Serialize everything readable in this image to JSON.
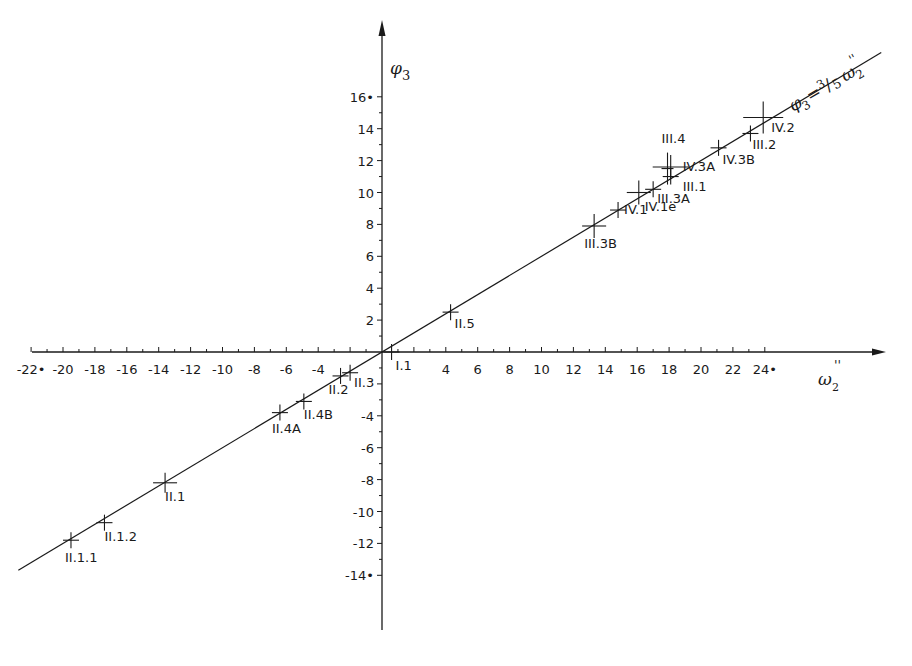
{
  "chart_data": {
    "type": "scatter",
    "title": "",
    "xlabel": "ω2''",
    "ylabel": "φ3",
    "xlim": [
      -22,
      24
    ],
    "ylim": [
      -14,
      16
    ],
    "grid": false,
    "x_ticks": [
      -22,
      -20,
      -18,
      -16,
      -14,
      -12,
      -10,
      -8,
      -6,
      -4,
      4,
      6,
      8,
      10,
      12,
      14,
      16,
      18,
      20,
      22,
      24
    ],
    "x_tick_labels": [
      "-22•",
      "-20",
      "-18",
      "-16",
      "-14",
      "-12",
      "-10",
      "-8",
      "-6",
      "-4",
      "4",
      "6",
      "8",
      "10",
      "12",
      "14",
      "16",
      "18",
      "20",
      "22",
      "24•"
    ],
    "y_ticks": [
      16,
      14,
      12,
      10,
      8,
      6,
      4,
      2,
      -4,
      -6,
      -8,
      -10,
      -12,
      -14
    ],
    "y_tick_labels": [
      "16•",
      "14",
      "12",
      "10",
      "8",
      "6",
      "4",
      "2",
      "-4",
      "-6",
      "-8",
      "-10",
      "-12",
      "-14•"
    ],
    "fit_line": {
      "label": "φ3 = 3/5 ω2''",
      "slope": 0.6,
      "intercept": 0,
      "x_range": [
        -22.8,
        31.3
      ]
    },
    "points": [
      {
        "label": "I.1",
        "x": 0.6,
        "y": 0.0
      },
      {
        "label": "II.5",
        "x": 4.3,
        "y": 2.5
      },
      {
        "label": "II.3",
        "x": -2.0,
        "y": -1.3
      },
      {
        "label": "II.2",
        "x": -2.6,
        "y": -1.5
      },
      {
        "label": "II.4B",
        "x": -4.9,
        "y": -3.1
      },
      {
        "label": "II.4A",
        "x": -6.4,
        "y": -3.8
      },
      {
        "label": "II.1",
        "x": -13.6,
        "y": -8.2
      },
      {
        "label": "II.1.2",
        "x": -17.4,
        "y": -10.7
      },
      {
        "label": "II.1.1",
        "x": -19.5,
        "y": -11.8
      },
      {
        "label": "III.3B",
        "x": 13.3,
        "y": 7.9
      },
      {
        "label": "IV.1",
        "x": 14.8,
        "y": 8.9
      },
      {
        "label": "IV.1e",
        "x": 16.1,
        "y": 10.0
      },
      {
        "label": "III.3A",
        "x": 17.0,
        "y": 10.2
      },
      {
        "label": "III.1",
        "x": 18.1,
        "y": 11.0
      },
      {
        "label": "III.4",
        "x": 17.9,
        "y": 11.5
      },
      {
        "label": "IV.3A",
        "x": 18.1,
        "y": 11.6
      },
      {
        "label": "IV.3B",
        "x": 21.1,
        "y": 12.8
      },
      {
        "label": "III.2",
        "x": 23.1,
        "y": 13.7
      },
      {
        "label": "IV.2",
        "x": 23.9,
        "y": 14.7
      }
    ]
  },
  "axes": {
    "x_title_main": "ω",
    "x_title_sub": "2",
    "x_title_sup": "''",
    "y_title_main": "φ",
    "y_title_sub": "3",
    "line_label_lhs": "φ",
    "line_label_lhs_sub": "3",
    "line_label_eq": "= ",
    "line_label_frac_num": "3",
    "line_label_frac_slash": "/",
    "line_label_frac_den": "5",
    "line_label_rhs": "ω",
    "line_label_rhs_sub": "2",
    "line_label_rhs_sup": "''"
  }
}
